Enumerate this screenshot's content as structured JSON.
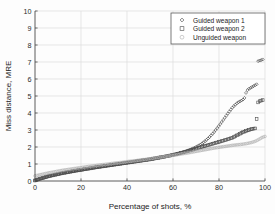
{
  "chart_data": {
    "type": "scatter",
    "title": "",
    "xlabel": "Percentage of shots, %",
    "ylabel": "Miss distance, MRE",
    "xlim": [
      0,
      100
    ],
    "ylim": [
      0,
      10
    ],
    "xticks": [
      0,
      20,
      40,
      60,
      80,
      100
    ],
    "yticks": [
      0,
      1,
      2,
      3,
      4,
      5,
      6,
      7,
      8,
      9,
      10
    ],
    "grid": true,
    "legend_position": "upper right",
    "series": [
      {
        "name": "Guided weapon 1",
        "marker": "diamond",
        "color": "#3b3b3b",
        "x": [
          0,
          1,
          2,
          3,
          4,
          5,
          6,
          8,
          10,
          12,
          14,
          16,
          18,
          20,
          22,
          24,
          26,
          28,
          30,
          32,
          34,
          36,
          38,
          40,
          42,
          44,
          46,
          48,
          50,
          52,
          54,
          56,
          58,
          60,
          62,
          64,
          66,
          68,
          70,
          72,
          74,
          76,
          78,
          80,
          82,
          84,
          86,
          88,
          90,
          91,
          92,
          93,
          94,
          95,
          96,
          96.5,
          97,
          98,
          98.5,
          99
        ],
        "y": [
          0.02,
          0.06,
          0.1,
          0.14,
          0.18,
          0.22,
          0.26,
          0.32,
          0.38,
          0.44,
          0.49,
          0.54,
          0.59,
          0.63,
          0.68,
          0.72,
          0.77,
          0.81,
          0.85,
          0.89,
          0.93,
          0.97,
          1.01,
          1.05,
          1.09,
          1.13,
          1.17,
          1.21,
          1.25,
          1.3,
          1.35,
          1.4,
          1.46,
          1.53,
          1.6,
          1.68,
          1.77,
          1.88,
          2.0,
          2.15,
          2.35,
          2.6,
          2.9,
          3.25,
          3.62,
          4.0,
          4.35,
          4.6,
          4.75,
          4.85,
          5.3,
          5.42,
          5.5,
          5.58,
          5.66,
          5.7,
          7.05,
          7.1,
          7.12,
          7.15
        ]
      },
      {
        "name": "Guided weapon 2",
        "marker": "square",
        "color": "#4a4a4a",
        "x": [
          0,
          1,
          2,
          3,
          4,
          5,
          6,
          8,
          10,
          12,
          14,
          16,
          18,
          20,
          22,
          24,
          26,
          28,
          30,
          32,
          34,
          36,
          38,
          40,
          42,
          44,
          46,
          48,
          50,
          52,
          54,
          56,
          58,
          60,
          62,
          64,
          66,
          68,
          70,
          72,
          74,
          76,
          78,
          80,
          82,
          84,
          86,
          88,
          90,
          91,
          92,
          93,
          94,
          95,
          96,
          97,
          97.5,
          98,
          98.5,
          99
        ],
        "y": [
          0.03,
          0.08,
          0.13,
          0.17,
          0.21,
          0.25,
          0.29,
          0.35,
          0.41,
          0.47,
          0.52,
          0.57,
          0.62,
          0.66,
          0.71,
          0.75,
          0.8,
          0.84,
          0.88,
          0.92,
          0.96,
          1.0,
          1.04,
          1.08,
          1.12,
          1.16,
          1.2,
          1.24,
          1.28,
          1.33,
          1.38,
          1.43,
          1.48,
          1.54,
          1.6,
          1.67,
          1.74,
          1.82,
          1.9,
          1.98,
          2.06,
          2.14,
          2.22,
          2.3,
          2.38,
          2.46,
          2.55,
          2.7,
          2.85,
          2.9,
          2.96,
          3.0,
          3.05,
          3.08,
          3.1,
          4.62,
          4.68,
          4.72,
          4.74,
          4.76
        ]
      },
      {
        "name": "Unguided weapon",
        "marker": "circle",
        "color": "#aeaeae",
        "x": [
          0,
          1,
          2,
          3,
          4,
          5,
          6,
          8,
          10,
          12,
          14,
          16,
          18,
          20,
          22,
          24,
          26,
          28,
          30,
          32,
          34,
          36,
          38,
          40,
          42,
          44,
          46,
          48,
          50,
          52,
          54,
          56,
          58,
          60,
          62,
          64,
          66,
          68,
          70,
          72,
          74,
          76,
          78,
          80,
          82,
          84,
          86,
          88,
          90,
          92,
          94,
          95,
          96,
          97,
          98,
          99,
          100
        ],
        "y": [
          0.3,
          0.33,
          0.36,
          0.39,
          0.42,
          0.45,
          0.48,
          0.53,
          0.58,
          0.63,
          0.67,
          0.71,
          0.75,
          0.79,
          0.83,
          0.87,
          0.9,
          0.94,
          0.97,
          1.0,
          1.04,
          1.07,
          1.1,
          1.14,
          1.17,
          1.2,
          1.24,
          1.27,
          1.31,
          1.35,
          1.39,
          1.43,
          1.47,
          1.51,
          1.55,
          1.6,
          1.64,
          1.69,
          1.74,
          1.79,
          1.84,
          1.89,
          1.94,
          1.98,
          2.02,
          2.06,
          2.1,
          2.13,
          2.16,
          2.2,
          2.26,
          2.3,
          2.35,
          2.42,
          2.5,
          2.58,
          2.62
        ]
      }
    ]
  },
  "legend": {
    "items": [
      {
        "label": "Guided weapon 1",
        "marker": "diamond-marker-icon"
      },
      {
        "label": "Guided weapon 2",
        "marker": "square-marker-icon"
      },
      {
        "label": "Unguided weapon",
        "marker": "circle-marker-icon"
      }
    ]
  }
}
